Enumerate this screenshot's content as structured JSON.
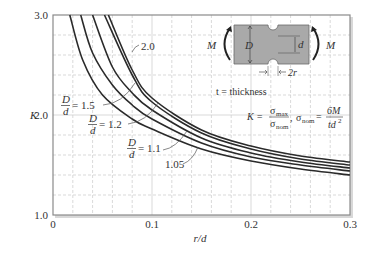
{
  "chart_data": {
    "type": "line",
    "xlabel": "r/d",
    "ylabel": "K",
    "xlim": [
      0,
      0.3
    ],
    "ylim": [
      1.0,
      3.0
    ],
    "x_ticks": [
      "0",
      "0.1",
      "0.2",
      "0.3"
    ],
    "y_ticks": [
      "1.0",
      "2.0",
      "3.0"
    ],
    "grid": true,
    "series": [
      {
        "name": "D/d = 2.0",
        "label": "2.0",
        "x": [
          0.056,
          0.08,
          0.1,
          0.15,
          0.2,
          0.25,
          0.3
        ],
        "y": [
          3.0,
          2.45,
          2.17,
          1.85,
          1.69,
          1.59,
          1.53
        ]
      },
      {
        "name": "D/d = 1.5",
        "label": "1.5",
        "x": [
          0.052,
          0.08,
          0.1,
          0.15,
          0.2,
          0.25,
          0.3
        ],
        "y": [
          3.0,
          2.4,
          2.13,
          1.82,
          1.66,
          1.56,
          1.5
        ]
      },
      {
        "name": "D/d = 1.2",
        "label": "1.2",
        "x": [
          0.04,
          0.06,
          0.08,
          0.1,
          0.15,
          0.2,
          0.25,
          0.3
        ],
        "y": [
          3.0,
          2.48,
          2.22,
          2.05,
          1.77,
          1.62,
          1.53,
          1.47
        ]
      },
      {
        "name": "D/d = 1.1",
        "label": "1.1",
        "x": [
          0.028,
          0.04,
          0.06,
          0.08,
          0.1,
          0.15,
          0.2,
          0.25,
          0.3
        ],
        "y": [
          3.0,
          2.62,
          2.3,
          2.1,
          1.96,
          1.72,
          1.58,
          1.5,
          1.44
        ]
      },
      {
        "name": "D/d = 1.05",
        "label": "1.05",
        "x": [
          0.017,
          0.03,
          0.05,
          0.08,
          0.1,
          0.15,
          0.2,
          0.25,
          0.3
        ],
        "y": [
          3.0,
          2.55,
          2.2,
          1.96,
          1.86,
          1.66,
          1.54,
          1.46,
          1.4
        ]
      }
    ],
    "annotations": {
      "thickness_note": "t = thickness",
      "formula": "K = σmax/σnom, σnom = 6M/td²",
      "diagram_labels": [
        "M",
        "D",
        "d",
        "M",
        "2r"
      ]
    }
  },
  "axes": {
    "y_tick_3": "3.0",
    "y_tick_2": "2.0",
    "y_tick_1": "1.0",
    "x_tick_0": "0",
    "x_tick_1": "0.1",
    "x_tick_2": "0.2",
    "x_tick_3": "0.3",
    "ylabel": "K",
    "xlabel": "r/d"
  },
  "labels": {
    "curve_20": "2.0",
    "curve_15_frac_num": "D",
    "curve_15_frac_den": "d",
    "curve_15_val": "= 1.5",
    "curve_12_frac_num": "D",
    "curve_12_frac_den": "d",
    "curve_12_val": "= 1.2",
    "curve_11_frac_num": "D",
    "curve_11_frac_den": "d",
    "curve_11_val": "= 1.1",
    "curve_105": "1.05"
  },
  "inset": {
    "moment_left": "M",
    "moment_right": "M",
    "width_D": "D",
    "width_d": "d",
    "notch": "2r",
    "thickness": "t = thickness",
    "formula_K": "K =",
    "sigma_max": "σ",
    "sub_max": "max",
    "sigma_nom": "σ",
    "sub_nom": "nom",
    "comma": ",",
    "sigma_nom2": "σ",
    "sub_nom2": "nom",
    "equals": "=",
    "num_6M": "6M",
    "den_td": "td",
    "den_sq": "2"
  },
  "colors": {
    "curve": "#2a2a2a",
    "grid": "#c8c8c8",
    "frame": "#8a8a8a",
    "bar_fill": "#a9a9a9",
    "background": "#ffffff"
  }
}
